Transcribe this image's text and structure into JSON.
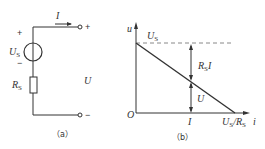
{
  "circuit_a": {
    "caption": "（a）",
    "source_label": "U",
    "source_sub": "S",
    "resistor_label": "R",
    "resistor_sub": "S",
    "current_label": "I",
    "voltage_label": "U",
    "plus_left": "+",
    "minus_left": "−",
    "terminal_plus": "+",
    "terminal_minus": "−"
  },
  "graph_b": {
    "caption": "（b）",
    "y_axis_label": "u",
    "x_axis_label": "i",
    "origin_label": "O",
    "us_label": "U",
    "us_sub": "S",
    "rsi_label": "R",
    "rsi_sub": "S",
    "rsi_tail": "I",
    "u_label": "U",
    "i_tick_label": "I",
    "intercept_label_a": "U",
    "intercept_sub_a": "S",
    "intercept_slash": "/R",
    "intercept_sub_b": "S"
  },
  "colors": {
    "line": "#333333",
    "dashed": "#888888"
  }
}
